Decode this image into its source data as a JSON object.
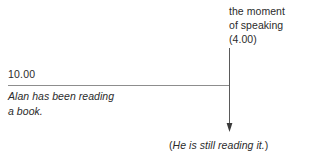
{
  "diagram": {
    "type": "timeline-annotation",
    "background_color": "#ffffff",
    "text_color": "#2b2b2b",
    "line_color": "#8d8d8d",
    "arrow_color": "#4a4a4a",
    "moment_annotation": {
      "line1": "the moment",
      "line2": "of speaking",
      "line3": "(4.00)"
    },
    "timeline": {
      "start_time_label": "10.00"
    },
    "sentence": {
      "line1": "Alan has been reading",
      "line2": "a book."
    },
    "caption": {
      "open_paren": "(",
      "text": "He is still reading it.",
      "close_paren": ")"
    }
  }
}
